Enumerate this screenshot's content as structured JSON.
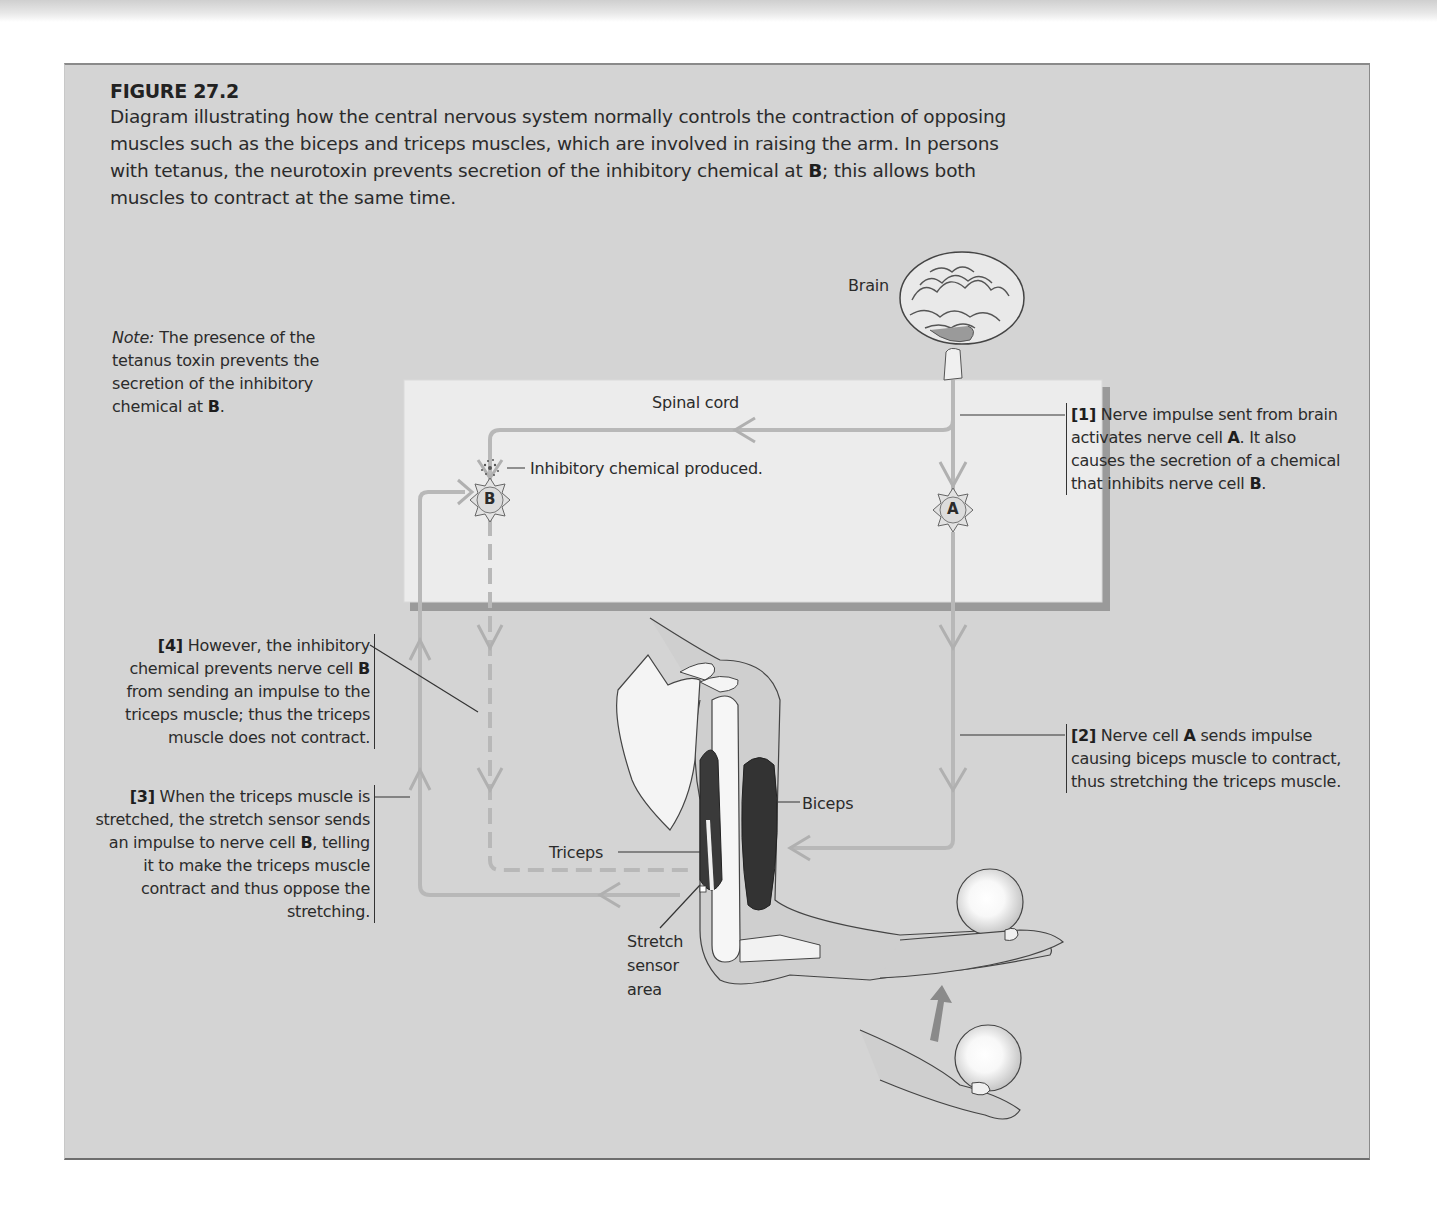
{
  "figure": {
    "number": "FIGURE 27.2",
    "caption": {
      "text": "Diagram illustrating how the central nervous system normally controls the contraction of opposing muscles such as the biceps and triceps muscles, which are involved in raising the arm. In persons with tetanus, the neurotoxin prevents secretion of the inhibitory chemical at ",
      "bold_end": "B",
      "tail": "; this allows both muscles to contract at the same time."
    }
  },
  "note": {
    "prefix": "Note:",
    "text": " The presence of the tetanus toxin prevents the secretion of the inhibitory chemical at ",
    "bold": "B",
    "tail": "."
  },
  "labels": {
    "brain": "Brain",
    "spinal_cord": "Spinal cord",
    "inhibitory_chemical": "Inhibitory chemical produced.",
    "nerve_cell_a": "A",
    "nerve_cell_b": "B",
    "biceps": "Biceps",
    "triceps": "Triceps",
    "stretch_sensor_line1": "Stretch",
    "stretch_sensor_line2": "sensor",
    "stretch_sensor_line3": "area"
  },
  "callouts": {
    "step1": {
      "num": "[1]",
      "text": " Nerve impulse sent from brain activates nerve cell ",
      "bold": "A",
      "text2": ". It also causes the secretion of a chemical that inhibits nerve cell ",
      "bold2": "B",
      "tail": "."
    },
    "step2": {
      "num": "[2]",
      "text": " Nerve cell ",
      "bold": "A",
      "tail": " sends impulse causing biceps muscle to contract, thus stretching the triceps muscle."
    },
    "step3": {
      "num": "[3]",
      "text": " When the triceps muscle is stretched, the stretch sensor sends an impulse to nerve cell ",
      "bold": "B",
      "tail": ", telling it to make the triceps muscle contract and thus oppose the stretching."
    },
    "step4": {
      "num": "[4]",
      "text": " However, the inhibitory chemical prevents nerve cell ",
      "bold": "B",
      "tail": " from sending an impulse to the triceps muscle; thus the triceps muscle does not contract."
    }
  },
  "colors": {
    "panel": "#d4d4d4",
    "spinal_box": "#ececec",
    "pathway": "#bcbcbc",
    "text": "#2b2b2b"
  }
}
